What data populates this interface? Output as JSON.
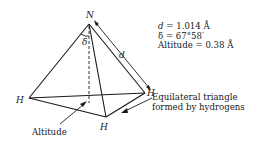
{
  "diagram": {
    "type": "ammonia-molecule-pyramid",
    "atoms": {
      "apex": "N",
      "base_left": "H",
      "base_front": "H",
      "base_right": "H"
    },
    "angle_label": "δ",
    "bond_label": "d",
    "parameters": [
      {
        "symbol": "d",
        "text": " = 1.014 Å"
      },
      {
        "symbol": "δ",
        "text": " = 67°58′"
      },
      {
        "symbol": "Altitude",
        "text": " = 0.38 Å"
      }
    ],
    "annotations": {
      "altitude": "Altitude",
      "base_line1": "Equilateral triangle",
      "base_line2": "formed by hydrogens"
    },
    "colors": {
      "line": "#1a1a1a",
      "background": "#ffffff"
    }
  }
}
